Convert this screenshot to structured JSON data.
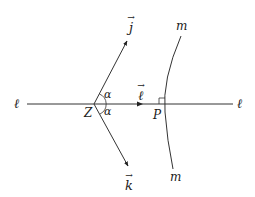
{
  "diagram": {
    "line_label_left": "ℓ",
    "line_label_right": "ℓ",
    "vertex_label": "Z",
    "foot_label": "P",
    "curve_label_top": "m",
    "curve_label_bottom": "m",
    "angle_label_upper": "α",
    "angle_label_lower": "α",
    "vector_j": "j",
    "vector_k": "k",
    "vector_l": "ℓ",
    "vector_arrow": "→",
    "stroke_color": "#333333"
  }
}
